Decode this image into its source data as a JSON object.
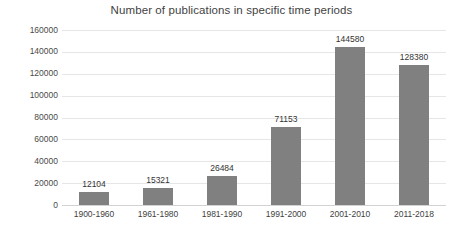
{
  "chart_data": {
    "type": "bar",
    "title": "Number of publications in specific time periods",
    "xlabel": "",
    "ylabel": "",
    "categories": [
      "1900-1960",
      "1961-1980",
      "1981-1990",
      "1991-2000",
      "2001-2010",
      "2011-2018"
    ],
    "values": [
      12104,
      15321,
      26484,
      71153,
      144580,
      128380
    ],
    "value_labels": [
      "12104",
      "15321",
      "26484",
      "71153",
      "144580",
      "128380"
    ],
    "ylim": [
      0,
      160000
    ],
    "ytick_values": [
      0,
      20000,
      40000,
      60000,
      80000,
      100000,
      120000,
      140000,
      160000
    ],
    "ytick_labels": [
      "0",
      "20000",
      "40000",
      "60000",
      "80000",
      "100000",
      "120000",
      "140000",
      "160000"
    ],
    "grid": "horizontal",
    "legend": "none",
    "bar_color": "#808080",
    "gridline_color": "#e6e6e6",
    "background_color": "#ffffff",
    "text_color": "#3f3f3f"
  }
}
